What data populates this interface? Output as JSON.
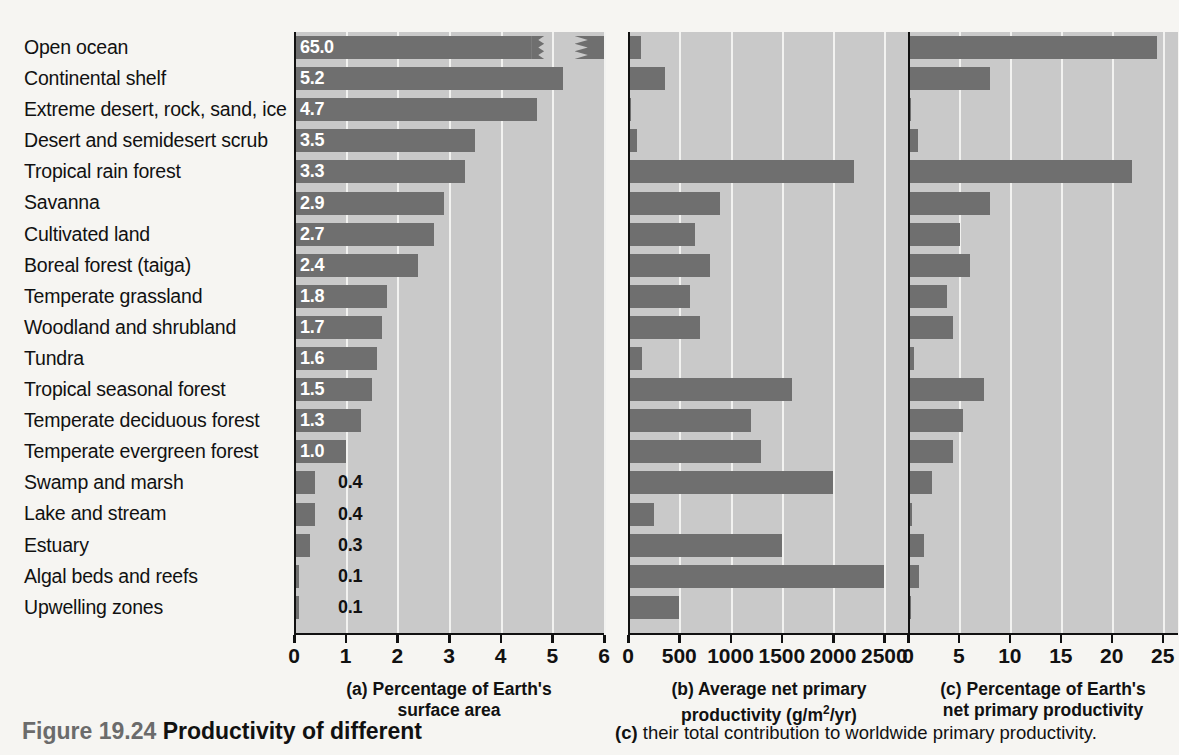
{
  "figure": {
    "number": "Figure 19.24",
    "title": "Productivity of different",
    "right_text_prefix": "(c)",
    "right_text": " their total contribution to worldwide primary productivity."
  },
  "panels": [
    {
      "key": "a",
      "prefix": "(a)",
      "caption_line1": "Percentage of Earth's",
      "caption_line2": "surface area",
      "ticks": [
        "0",
        "1",
        "2",
        "3",
        "4",
        "5",
        "6"
      ],
      "axis_max": 6
    },
    {
      "key": "b",
      "prefix": "(b)",
      "caption_line1": "Average net primary",
      "caption_line2": "productivity (g/m2/yr)",
      "ticks": [
        "0",
        "500",
        "1000",
        "1500",
        "2000",
        "2500"
      ],
      "axis_max": 2750
    },
    {
      "key": "c",
      "prefix": "(c)",
      "caption_line1": "Percentage of Earth's",
      "caption_line2": "net primary productivity",
      "ticks": [
        "0",
        "5",
        "10",
        "15",
        "20",
        "25"
      ],
      "axis_max": 26.5
    }
  ],
  "chart_data": {
    "type": "bar",
    "layout": "three horizontal bar panels sharing one category axis",
    "grid": true,
    "legend": "none",
    "categories": [
      "Open ocean",
      "Continental shelf",
      "Extreme desert, rock, sand, ice",
      "Desert and semidesert scrub",
      "Tropical rain forest",
      "Savanna",
      "Cultivated land",
      "Boreal forest (taiga)",
      "Temperate grassland",
      "Woodland and shrubland",
      "Tundra",
      "Tropical seasonal forest",
      "Temperate deciduous forest",
      "Temperate evergreen forest",
      "Swamp and marsh",
      "Lake and stream",
      "Estuary",
      "Algal beds and reefs",
      "Upwelling zones"
    ],
    "series": [
      {
        "name": "Percentage of Earth's surface area",
        "panel": "a",
        "xlabel": "Percentage of Earth's surface area",
        "xlim": [
          0,
          6
        ],
        "broken_axis": true,
        "broken_value_index": 0,
        "labels": [
          "65.0",
          "5.2",
          "4.7",
          "3.5",
          "3.3",
          "2.9",
          "2.7",
          "2.4",
          "1.8",
          "1.7",
          "1.6",
          "1.5",
          "1.3",
          "1.0",
          "0.4",
          "0.4",
          "0.3",
          "0.1",
          "0.1"
        ],
        "values": [
          65.0,
          5.2,
          4.7,
          3.5,
          3.3,
          2.9,
          2.7,
          2.4,
          1.8,
          1.7,
          1.6,
          1.5,
          1.3,
          1.0,
          0.4,
          0.4,
          0.3,
          0.1,
          0.1
        ]
      },
      {
        "name": "Average net primary productivity (g/m2/yr)",
        "panel": "b",
        "xlabel": "Average net primary productivity (g/m2/yr)",
        "xlim": [
          0,
          2750
        ],
        "values": [
          125,
          360,
          3,
          90,
          2200,
          900,
          650,
          800,
          600,
          700,
          140,
          1600,
          1200,
          1300,
          2000,
          250,
          1500,
          2500,
          500
        ]
      },
      {
        "name": "Percentage of Earth's net primary productivity",
        "panel": "c",
        "xlabel": "Percentage of Earth's net primary productivity",
        "xlim": [
          0,
          26.5
        ],
        "values": [
          24.4,
          8.0,
          0.1,
          1.0,
          22.0,
          8.0,
          5.1,
          6.1,
          3.8,
          4.4,
          0.6,
          7.5,
          5.4,
          4.4,
          2.4,
          0.4,
          1.6,
          1.1,
          0.3
        ]
      }
    ]
  },
  "colors": {
    "bar": "#6f6f6f",
    "plot_background": "#c9c9c9",
    "page_background": "#f6f5f2",
    "gridline": "#f2f2f0",
    "axis": "#111111",
    "label_text": "#111111",
    "value_text_inside": "#ffffff",
    "fignum_text": "#6b6b6b"
  }
}
